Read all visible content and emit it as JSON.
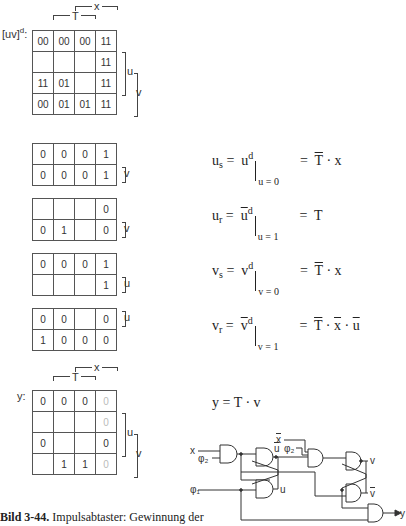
{
  "main_map": {
    "label": "[uv]",
    "label_sup": "d",
    "label_suffix": ":",
    "col_labels": {
      "T": "T",
      "x": "x"
    },
    "row_labels": {
      "u": "u",
      "v": "v"
    },
    "cells": [
      [
        "00",
        "00",
        "00",
        "11"
      ],
      [
        "",
        "",
        "",
        "11"
      ],
      [
        "11",
        "01",
        "",
        "11"
      ],
      [
        "00",
        "01",
        "01",
        "11"
      ]
    ]
  },
  "sub_maps": [
    {
      "name": "us-map",
      "side_label": "v",
      "cells": [
        [
          "0",
          "0",
          "0",
          "1"
        ],
        [
          "0",
          "0",
          "0",
          "1"
        ]
      ]
    },
    {
      "name": "ur-map",
      "side_label": "v",
      "cells": [
        [
          "",
          "",
          "",
          "0"
        ],
        [
          "0",
          "1",
          "",
          "0"
        ]
      ]
    },
    {
      "name": "vs-map",
      "side_label": "u",
      "cells": [
        [
          "0",
          "0",
          "0",
          "1"
        ],
        [
          "",
          "",
          "",
          "1"
        ]
      ]
    },
    {
      "name": "vr-map",
      "side_label": "u",
      "cells": [
        [
          "0",
          "0",
          "",
          "0"
        ],
        [
          "1",
          "0",
          "0",
          "0"
        ]
      ]
    }
  ],
  "equations": [
    {
      "lhs": "u",
      "lhs_sub": "s",
      "mid": "u",
      "mid_bar": false,
      "mid_sup": "d",
      "cond": "u = 0",
      "rhs_parts": [
        {
          "t": "T",
          "bar": true
        },
        {
          "t": " · "
        },
        {
          "t": "x",
          "bar": false
        }
      ]
    },
    {
      "lhs": "u",
      "lhs_sub": "r",
      "mid": "u",
      "mid_bar": true,
      "mid_sup": "d",
      "cond": "u = 1",
      "rhs_parts": [
        {
          "t": "T",
          "bar": false
        }
      ]
    },
    {
      "lhs": "v",
      "lhs_sub": "s",
      "mid": "v",
      "mid_bar": false,
      "mid_sup": "d",
      "cond": "v = 0",
      "rhs_parts": [
        {
          "t": "T",
          "bar": true
        },
        {
          "t": " · "
        },
        {
          "t": "x",
          "bar": false
        }
      ]
    },
    {
      "lhs": "v",
      "lhs_sub": "r",
      "mid": "v",
      "mid_bar": true,
      "mid_sup": "d",
      "cond": "v = 1",
      "rhs_parts": [
        {
          "t": "T",
          "bar": true
        },
        {
          "t": " · "
        },
        {
          "t": "x",
          "bar": true
        },
        {
          "t": " · "
        },
        {
          "t": "u",
          "bar": true
        }
      ]
    }
  ],
  "y_map": {
    "label": "y:",
    "col_labels": {
      "T": "T",
      "x": "x"
    },
    "row_labels": {
      "u": "u",
      "v": "v"
    },
    "cells": [
      [
        {
          "v": "0"
        },
        {
          "v": "0"
        },
        {
          "v": "0"
        },
        {
          "v": "0",
          "grey": true
        }
      ],
      [
        {
          "v": ""
        },
        {
          "v": ""
        },
        {
          "v": ""
        },
        {
          "v": "0",
          "grey": true
        }
      ],
      [
        {
          "v": "0"
        },
        {
          "v": ""
        },
        {
          "v": ""
        },
        {
          "v": "0"
        }
      ],
      [
        {
          "v": ""
        },
        {
          "v": "1"
        },
        {
          "v": "1"
        },
        {
          "v": "0",
          "grey": true
        }
      ]
    ]
  },
  "y_equation": {
    "text": "y  =  T · v"
  },
  "circuit": {
    "inputs": {
      "x": "x",
      "phi2": "φ₂",
      "phi1": "φ₁",
      "xbar": "x",
      "phi2b": "φ₂"
    },
    "outputs": {
      "ubar": "u",
      "u": "u",
      "v": "v",
      "vbar": "v",
      "y": "y"
    }
  },
  "caption": {
    "bold": "Bild 3-44.",
    "text": " Impulsabtaster: Gewinnung der"
  }
}
